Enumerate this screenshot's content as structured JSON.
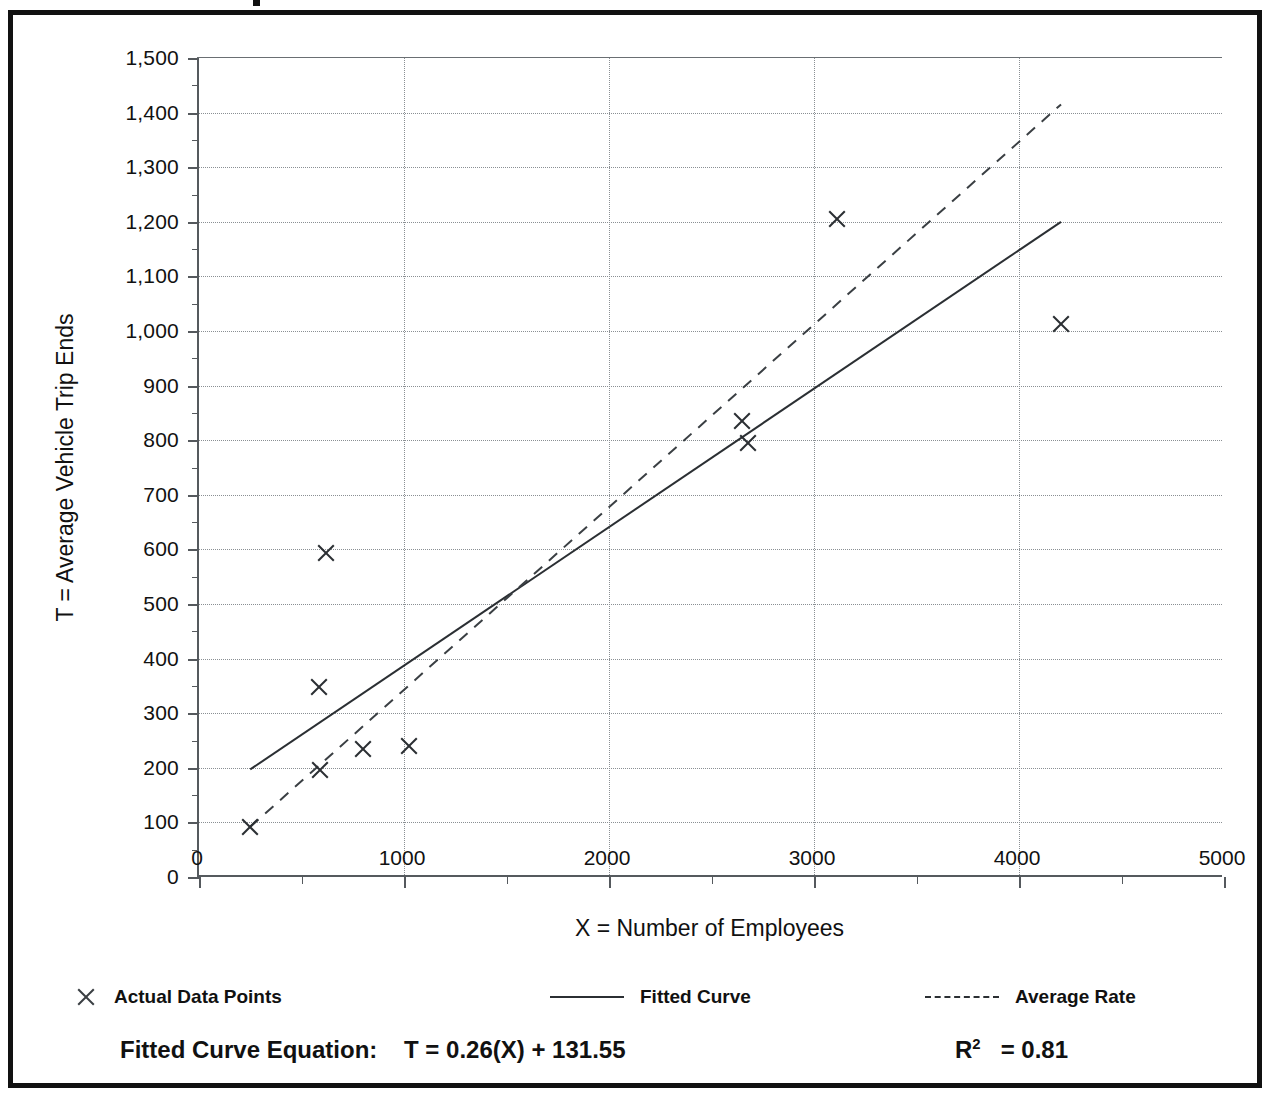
{
  "figure": {
    "frame_color": "#111111",
    "background": "#ffffff"
  },
  "chart_data": {
    "type": "scatter",
    "title": "",
    "xlabel": "X = Number of Employees",
    "ylabel": "T = Average Vehicle Trip Ends",
    "xlim": [
      0,
      5000
    ],
    "ylim": [
      0,
      1500
    ],
    "x_major_step": 1000,
    "x_minor_step": 500,
    "y_major_step": 100,
    "y_minor_step": 50,
    "grid": true,
    "grid_style": "dotted",
    "legend_position": "below-axes",
    "x_ticks": [
      0,
      1000,
      2000,
      3000,
      4000,
      5000
    ],
    "x_tick_labels": [
      "0",
      "1000",
      "2000",
      "3000",
      "4000",
      "5000"
    ],
    "y_ticks": [
      0,
      100,
      200,
      300,
      400,
      500,
      600,
      700,
      800,
      900,
      1000,
      1100,
      1200,
      1300,
      1400,
      1500
    ],
    "y_tick_labels": [
      "0",
      "100",
      "200",
      "300",
      "400",
      "500",
      "600",
      "700",
      "800",
      "900",
      "1,000",
      "1,100",
      "1,200",
      "1,300",
      "1,400",
      "1,500"
    ],
    "series": [
      {
        "name": "Actual Data Points",
        "type": "scatter",
        "marker": "x",
        "points": [
          {
            "x": 250,
            "y": 92
          },
          {
            "x": 590,
            "y": 196
          },
          {
            "x": 585,
            "y": 348
          },
          {
            "x": 620,
            "y": 593
          },
          {
            "x": 800,
            "y": 235
          },
          {
            "x": 1025,
            "y": 240
          },
          {
            "x": 2650,
            "y": 835
          },
          {
            "x": 2680,
            "y": 795
          },
          {
            "x": 3110,
            "y": 1205
          },
          {
            "x": 4205,
            "y": 1013
          }
        ]
      },
      {
        "name": "Fitted Curve",
        "type": "line",
        "style": "solid",
        "endpoints": [
          {
            "x": 250,
            "y": 197
          },
          {
            "x": 4205,
            "y": 1200
          }
        ]
      },
      {
        "name": "Average Rate",
        "type": "line",
        "style": "dashed",
        "endpoints": [
          {
            "x": 250,
            "y": 92
          },
          {
            "x": 4205,
            "y": 1415
          }
        ]
      }
    ]
  },
  "legend": {
    "items": [
      {
        "label": "Actual Data Points",
        "marker": "x"
      },
      {
        "label": "Fitted Curve",
        "marker": "solid-line"
      },
      {
        "label": "Average Rate",
        "marker": "dashed-line"
      }
    ]
  },
  "footnote": {
    "equation_label": "Fitted Curve Equation:",
    "equation_value": "T = 0.26(X) + 131.55",
    "r_squared_symbol": "R",
    "r_squared_exponent": "2",
    "r_squared_value": "= 0.81"
  }
}
